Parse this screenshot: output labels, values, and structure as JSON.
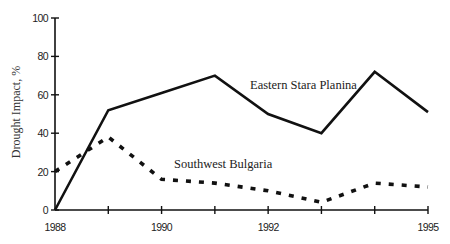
{
  "chart_data": {
    "type": "line",
    "title": "",
    "xlabel": "",
    "ylabel": "Drought Impact, %",
    "ylim": [
      0,
      100
    ],
    "xlim": [
      1988,
      1995
    ],
    "grid": false,
    "legend": "inline labels",
    "x": [
      1988,
      1989,
      1990,
      1991,
      1992,
      1993,
      1994,
      1995
    ],
    "x_tick_labels": [
      "1988",
      "",
      "1990",
      "",
      "1992",
      "",
      "",
      "1995"
    ],
    "y_ticks": [
      0,
      20,
      40,
      60,
      80,
      100
    ],
    "y_tick_labels": [
      "0",
      "20",
      "40",
      "60",
      "80",
      "100"
    ],
    "series": [
      {
        "name": "Eastern Stara Planina",
        "style": "solid",
        "values": [
          0,
          52,
          61,
          70,
          50,
          40,
          72,
          51
        ]
      },
      {
        "name": "Southwest Bulgaria",
        "style": "dashed",
        "values": [
          20,
          38,
          16,
          14,
          10,
          4,
          14,
          12
        ]
      }
    ],
    "annotations": [
      {
        "text": "Eastern Stara Planina",
        "series": 0
      },
      {
        "text": "Southwest Bulgaria",
        "series": 1
      }
    ]
  },
  "layout": {
    "plot": {
      "x0": 55,
      "x1": 428,
      "y0": 210,
      "y1": 18
    },
    "label_positions": [
      {
        "x": 250,
        "y": 89
      },
      {
        "x": 174,
        "y": 168
      }
    ],
    "line_color": "#111111"
  }
}
